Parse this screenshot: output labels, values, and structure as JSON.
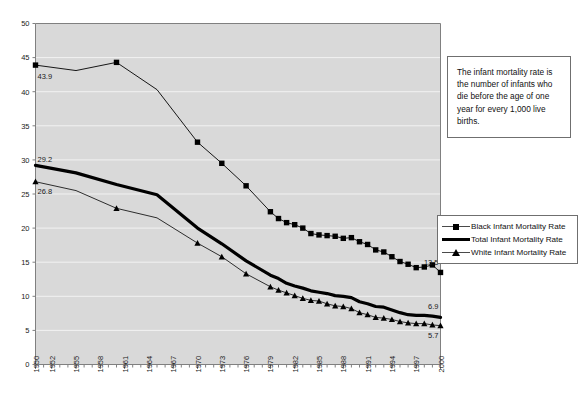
{
  "annotation": {
    "text": "The infant mortality rate is the number of infants who die before the age of one year for every 1,000 live births."
  },
  "legend": {
    "position": "right",
    "items": [
      {
        "label": "Black Infant Mortality Rate",
        "marker": "square",
        "style": "thin-line-square-marker"
      },
      {
        "label": "Total Infant Mortality Rate",
        "marker": "none",
        "style": "thick-line"
      },
      {
        "label": "White Infant Mortality Rate",
        "marker": "triangle",
        "style": "thin-line-triangle-marker"
      }
    ]
  },
  "data_labels": {
    "black_start": "43.9",
    "black_end": "13.5",
    "total_start": "29.2",
    "total_end": "6.9",
    "white_start": "26.8",
    "white_end": "5.7"
  },
  "axis": {
    "y_ticks": [
      "0",
      "5",
      "10",
      "15",
      "20",
      "25",
      "30",
      "35",
      "40",
      "45",
      "50"
    ],
    "x_ticks": [
      "1950",
      "1952",
      "1955",
      "1958",
      "1961",
      "1964",
      "1967",
      "1970",
      "1973",
      "1976",
      "1979",
      "1982",
      "1985",
      "1988",
      "1991",
      "1994",
      "1997",
      "2000"
    ]
  },
  "colors": {
    "plot_background": "#d9d9d9",
    "gridline": "#f2f2f2",
    "axis_line": "#808080",
    "series_black": "#000000",
    "series_total": "#000000",
    "series_white": "#000000",
    "box_border": "#6f6f6f",
    "page_background": "#ffffff"
  },
  "chart_data": {
    "type": "line",
    "title": "",
    "xlabel": "",
    "ylabel": "",
    "ylim": [
      0,
      50
    ],
    "xlim": [
      1950,
      2000
    ],
    "grid": true,
    "legend_position": "right",
    "x": [
      1950,
      1955,
      1960,
      1965,
      1970,
      1973,
      1976,
      1979,
      1980,
      1981,
      1982,
      1983,
      1984,
      1985,
      1986,
      1987,
      1988,
      1989,
      1990,
      1991,
      1992,
      1993,
      1994,
      1995,
      1996,
      1997,
      1998,
      1999,
      2000
    ],
    "series": [
      {
        "name": "Black Infant Mortality Rate",
        "marker": "square",
        "values": [
          43.9,
          43.1,
          44.3,
          40.3,
          32.6,
          29.5,
          26.2,
          22.4,
          21.4,
          20.8,
          20.5,
          20.0,
          19.2,
          19.0,
          18.9,
          18.8,
          18.5,
          18.6,
          18.0,
          17.6,
          16.8,
          16.5,
          15.8,
          15.1,
          14.7,
          14.2,
          14.3,
          14.6,
          13.5
        ]
      },
      {
        "name": "Total Infant Mortality Rate",
        "marker": "none",
        "values": [
          29.2,
          28.1,
          26.4,
          24.9,
          20.0,
          17.7,
          15.2,
          13.1,
          12.6,
          11.9,
          11.5,
          11.2,
          10.8,
          10.6,
          10.4,
          10.1,
          10.0,
          9.8,
          9.2,
          8.9,
          8.5,
          8.4,
          8.0,
          7.6,
          7.3,
          7.2,
          7.2,
          7.1,
          6.9
        ]
      },
      {
        "name": "White Infant Mortality Rate",
        "marker": "triangle",
        "values": [
          26.8,
          25.5,
          22.9,
          21.5,
          17.8,
          15.8,
          13.3,
          11.4,
          10.9,
          10.5,
          10.1,
          9.7,
          9.4,
          9.3,
          8.9,
          8.6,
          8.5,
          8.2,
          7.6,
          7.3,
          6.9,
          6.8,
          6.6,
          6.3,
          6.1,
          6.0,
          6.0,
          5.8,
          5.7
        ]
      }
    ]
  }
}
